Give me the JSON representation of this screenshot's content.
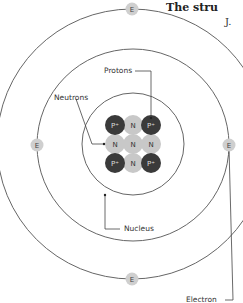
{
  "title": "The stru",
  "subtitle": "J.",
  "labels": {
    "protons": "Protons",
    "neutrons": "Neutrons",
    "nucleus": "Nucleus",
    "electron": "Electron"
  },
  "electron_symbol": "E",
  "nucleus": {
    "grid": [
      [
        "P+",
        "N",
        "P+"
      ],
      [
        "N",
        "N",
        "N"
      ],
      [
        "P+",
        "N",
        "P+"
      ]
    ],
    "proton_symbol": "P+",
    "neutron_symbol": "N"
  },
  "colors": {
    "proton": "#3a3a3a",
    "neutron": "#c8c8c8",
    "electron": "#cfcfcf",
    "orbit": "#555555"
  }
}
